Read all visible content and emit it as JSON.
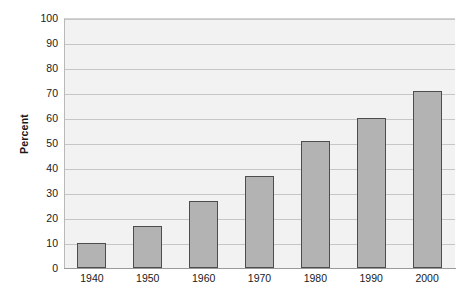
{
  "chart_data": {
    "type": "bar",
    "title": "",
    "subtitle": "",
    "xlabel": "",
    "ylabel": "Percent",
    "categories": [
      "1940",
      "1950",
      "1960",
      "1970",
      "1980",
      "1990",
      "2000"
    ],
    "values": [
      10,
      17,
      27,
      37,
      51,
      60,
      71
    ],
    "ylim": [
      0,
      100
    ],
    "ytick_labels": [
      "0",
      "10",
      "20",
      "30",
      "40",
      "50",
      "60",
      "70",
      "80",
      "90",
      "100"
    ],
    "ytick_values": [
      0,
      10,
      20,
      30,
      40,
      50,
      60,
      70,
      80,
      90,
      100
    ],
    "grid": "horizontal",
    "legend": "none",
    "annotations": [],
    "series": [
      {
        "name": "Percent",
        "values": [
          10,
          17,
          27,
          37,
          51,
          60,
          71
        ]
      }
    ],
    "colors": {
      "bar_fill": "#b3b3b3",
      "bar_border": "#4d4d4d",
      "plot_background": "#f2f2f2",
      "gridline": "#c6c6c6",
      "axis_line": "#9a9a9a",
      "text": "#1a1a1a",
      "page_background": "#ffffff"
    }
  }
}
